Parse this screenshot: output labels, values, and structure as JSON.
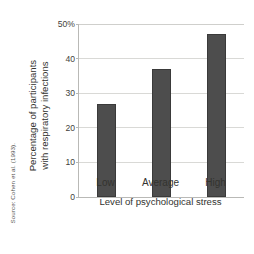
{
  "chart_data": {
    "type": "bar",
    "title": "",
    "categories": [
      "Low",
      "Average",
      "High"
    ],
    "values": [
      27,
      37,
      47
    ],
    "series": [
      {
        "name": "Percentage with respiratory infections",
        "values": [
          27,
          37,
          47
        ]
      }
    ],
    "xlabel": "Level of psychological stress",
    "ylabel": "Percentage of participants with respiratory infections",
    "ylabel_line1": "Percentage of participants",
    "ylabel_line2": "with respiratory infections",
    "ylim": [
      0,
      50
    ],
    "yticks": [
      0,
      10,
      20,
      30,
      40,
      50
    ],
    "ytick_labels": [
      "0",
      "10",
      "20",
      "30",
      "40",
      "50%"
    ],
    "grid": true,
    "legend": "none",
    "bar_color": "#4d4d4d",
    "gridline_color": "#d9d9d6",
    "axis_color": "#b9b9b6",
    "background_color": "#ffffff",
    "text_color": "#33332f"
  },
  "annotations": {
    "source_note": "Source: Cohen et al. (1993)."
  }
}
